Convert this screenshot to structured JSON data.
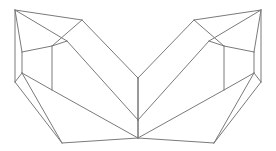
{
  "figure": {
    "background_color": "#ffffff",
    "stroke_color": "#7a7a7a",
    "stroke_color_strong": "#6e6e6e",
    "stroke_width": 1,
    "canvas": {
      "width": 276,
      "height": 151
    }
  },
  "chart_data": {
    "type": "line",
    "xlabel": "",
    "ylabel": "",
    "xlim": [
      0,
      276
    ],
    "ylim": [
      0,
      151
    ],
    "grid": false,
    "legend": "none",
    "vertices": {
      "left_apex": [
        15,
        10
      ],
      "left_top_ridge": [
        82,
        20
      ],
      "left_inner_ridge": [
        67,
        41
      ],
      "left_upper_left": [
        22,
        52
      ],
      "left_upper_right": [
        52,
        46
      ],
      "left_lower_left": [
        22,
        73
      ],
      "left_lower_right": [
        52,
        90
      ],
      "left_bottom_outer": [
        15,
        82
      ],
      "left_bottom_point": [
        62,
        143
      ],
      "center_notch_top": [
        138,
        78
      ],
      "center_notch_mid": [
        138,
        120
      ],
      "center_bottom": [
        138,
        138
      ],
      "right_apex": [
        261,
        10
      ],
      "right_top_ridge": [
        194,
        20
      ],
      "right_inner_ridge": [
        209,
        41
      ],
      "right_upper_right": [
        254,
        52
      ],
      "right_upper_left": [
        224,
        46
      ],
      "right_lower_right": [
        254,
        73
      ],
      "right_lower_left": [
        224,
        90
      ],
      "right_bottom_outer": [
        261,
        82
      ],
      "right_bottom_point": [
        214,
        143
      ]
    },
    "edges": [
      {
        "name": "left-apex-to-outer-bottom",
        "points": "15,10 15,82"
      },
      {
        "name": "left-apex-to-top-ridge",
        "points": "15,10 82,20"
      },
      {
        "name": "left-apex-to-inner-ridge",
        "points": "15,10 67,41"
      },
      {
        "name": "left-apex-to-upper-left",
        "points": "15,10 22,52"
      },
      {
        "name": "left-top-ridge-to-notch",
        "points": "82,20 138,78"
      },
      {
        "name": "left-top-ridge-to-upper-right",
        "points": "82,20 52,46"
      },
      {
        "name": "left-inner-ridge-to-upper-right",
        "points": "67,41 52,46"
      },
      {
        "name": "left-inner-ridge-to-notch-mid",
        "points": "67,41 138,120"
      },
      {
        "name": "left-upper-quad-top",
        "points": "22,52 52,46"
      },
      {
        "name": "left-upper-quad-left",
        "points": "22,52 22,73"
      },
      {
        "name": "left-upper-quad-right",
        "points": "52,46 52,90"
      },
      {
        "name": "left-outer-to-lower-left",
        "points": "15,82 22,73"
      },
      {
        "name": "left-lower-left-to-quad-right",
        "points": "22,73 52,90"
      },
      {
        "name": "left-lower-left-to-bottom-point",
        "points": "22,73 62,143"
      },
      {
        "name": "left-outer-bottom-down",
        "points": "15,82 62,143"
      },
      {
        "name": "left-quad-right-to-center-bottom",
        "points": "52,90 138,138"
      },
      {
        "name": "left-bottom-point-to-center-bottom",
        "points": "62,143 138,138"
      },
      {
        "name": "center-vertical-upper",
        "points": "138,78 138,120"
      },
      {
        "name": "center-vertical-lower",
        "points": "138,120 138,138"
      },
      {
        "name": "right-apex-to-outer-bottom",
        "points": "261,10 261,82"
      },
      {
        "name": "right-apex-to-top-ridge",
        "points": "261,10 194,20"
      },
      {
        "name": "right-apex-to-inner-ridge",
        "points": "261,10 209,41"
      },
      {
        "name": "right-apex-to-upper-right",
        "points": "261,10 254,52"
      },
      {
        "name": "right-top-ridge-to-notch",
        "points": "194,20 138,78"
      },
      {
        "name": "right-top-ridge-to-upper-left",
        "points": "194,20 224,46"
      },
      {
        "name": "right-inner-ridge-to-upper-left",
        "points": "209,41 224,46"
      },
      {
        "name": "right-inner-ridge-to-notch-mid",
        "points": "209,41 138,120"
      },
      {
        "name": "right-upper-quad-top",
        "points": "254,52 224,46"
      },
      {
        "name": "right-upper-quad-right",
        "points": "254,52 254,73"
      },
      {
        "name": "right-upper-quad-left",
        "points": "224,46 224,90"
      },
      {
        "name": "right-outer-to-lower-right",
        "points": "261,82 254,73"
      },
      {
        "name": "right-lower-right-to-quad-left",
        "points": "254,73 224,90"
      },
      {
        "name": "right-lower-right-to-bottom-point",
        "points": "254,73 214,143"
      },
      {
        "name": "right-outer-bottom-down",
        "points": "261,82 214,143"
      },
      {
        "name": "right-quad-left-to-center-bottom",
        "points": "224,90 138,138"
      },
      {
        "name": "right-bottom-point-to-center-bottom",
        "points": "214,143 138,138"
      }
    ]
  }
}
